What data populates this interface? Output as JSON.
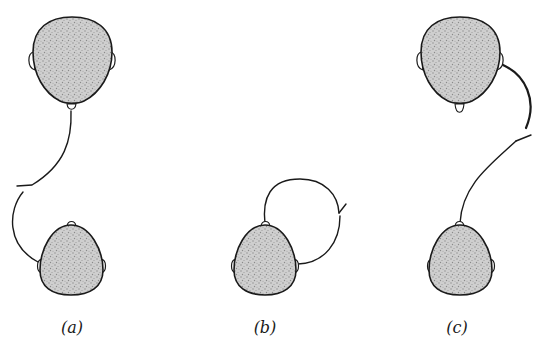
{
  "figure": {
    "panels": [
      {
        "id": "a",
        "label": "(a)",
        "description": "Large head above connected from nose/chin down via a wire with a break to the left ear of a small head below"
      },
      {
        "id": "b",
        "label": "(b)",
        "description": "Single small head with a wire looping from the crown over to the right ear, with a break on the right side"
      },
      {
        "id": "c",
        "label": "(c)",
        "description": "Large head above with wire from right ear curving down, break, then continuing to the crown of a small head below"
      }
    ],
    "colors": {
      "stroke": "#1a1a1a",
      "head_fill": "#c8c8c8",
      "background": "#ffffff"
    }
  }
}
